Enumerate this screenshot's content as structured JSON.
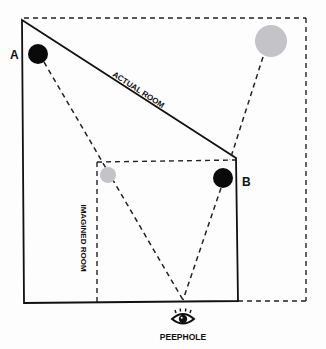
{
  "diagram": {
    "labels": {
      "point_a": "A",
      "point_b": "B",
      "actual_room": "ACTUAL ROOM",
      "imagined_room": "IMAGINED ROOM",
      "peephole": "PEEPHOLE"
    },
    "colors": {
      "ink": "#111111",
      "real_object": "#0a0a0a",
      "imagined_object": "#c4c4c8",
      "background": "#fdfdfd"
    },
    "icons": {
      "peephole": "eye-icon"
    }
  }
}
